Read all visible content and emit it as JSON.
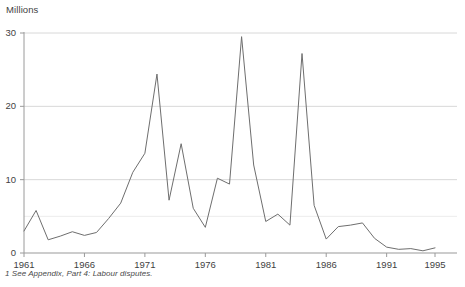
{
  "axis_unit_label": "Millions",
  "footnote": "1 See Appendix, Part 4: Labour disputes.",
  "y_ticks": [
    "0",
    "10",
    "20",
    "30"
  ],
  "x_ticks": [
    "1961",
    "1966",
    "1971",
    "1976",
    "1981",
    "1986",
    "1991",
    "1995"
  ],
  "colors": {
    "line": "#6e6e6e",
    "axis": "#9a9a9a",
    "grid": "#e2e2e2",
    "text": "#3f3f3f"
  },
  "chart_data": {
    "type": "line",
    "title": "",
    "xlabel": "",
    "ylabel": "Millions",
    "xlim": [
      1961,
      1995
    ],
    "ylim": [
      0,
      30
    ],
    "grid": true,
    "gridlines_y": [
      5,
      10,
      20,
      30
    ],
    "y_tick_values": [
      0,
      10,
      20,
      30
    ],
    "x_tick_values": [
      1961,
      1966,
      1971,
      1976,
      1981,
      1986,
      1991,
      1995
    ],
    "legend": null,
    "legend_position": "none",
    "annotations": [
      "1 See Appendix, Part 4: Labour disputes."
    ],
    "x": [
      1961,
      1962,
      1963,
      1964,
      1965,
      1966,
      1967,
      1968,
      1969,
      1970,
      1971,
      1972,
      1973,
      1974,
      1975,
      1976,
      1977,
      1978,
      1979,
      1980,
      1981,
      1982,
      1983,
      1984,
      1985,
      1986,
      1987,
      1988,
      1989,
      1990,
      1991,
      1992,
      1993,
      1994,
      1995
    ],
    "series": [
      {
        "name": "Working days lost through labour disputes",
        "values": [
          3.0,
          5.8,
          1.8,
          2.3,
          2.9,
          2.4,
          2.8,
          4.7,
          6.8,
          11.0,
          13.6,
          24.4,
          7.2,
          14.9,
          6.1,
          3.5,
          10.2,
          9.4,
          29.5,
          12.0,
          4.3,
          5.3,
          3.8,
          27.2,
          6.5,
          1.9,
          3.6,
          3.8,
          4.1,
          2.0,
          0.8,
          0.5,
          0.6,
          0.3,
          0.7
        ]
      }
    ]
  }
}
